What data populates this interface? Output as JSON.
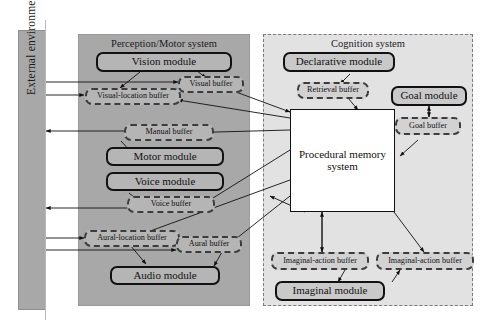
{
  "figure": {
    "type": "diagram",
    "background": "#ffffff"
  },
  "environment": {
    "label": "External environment",
    "color": "#a8a8a8"
  },
  "panels": {
    "perception": {
      "title": "Perception/Motor system",
      "color": "#a8a8a8",
      "border": "solid"
    },
    "cognition": {
      "title": "Cognition system",
      "color": "#e2e2e2",
      "border": "dashed"
    }
  },
  "nodes": {
    "vision_module": {
      "label": "Vision module",
      "kind": "module"
    },
    "visual_buffer": {
      "label": "Visual buffer",
      "kind": "buffer"
    },
    "visual_location_buffer": {
      "label": "Visual-location buffer",
      "kind": "buffer"
    },
    "manual_buffer": {
      "label": "Manual buffer",
      "kind": "buffer"
    },
    "motor_module": {
      "label": "Motor module",
      "kind": "module"
    },
    "voice_module": {
      "label": "Voice module",
      "kind": "module"
    },
    "voice_buffer": {
      "label": "Voice buffer",
      "kind": "buffer"
    },
    "aural_location_buffer": {
      "label": "Aural-location buffer",
      "kind": "buffer"
    },
    "aural_buffer": {
      "label": "Aural buffer",
      "kind": "buffer"
    },
    "audio_module": {
      "label": "Audio module",
      "kind": "module"
    },
    "declarative_module": {
      "label": "Declarative module",
      "kind": "module"
    },
    "retrieval_buffer": {
      "label": "Retrieval buffer",
      "kind": "buffer"
    },
    "goal_module": {
      "label": "Goal module",
      "kind": "module"
    },
    "goal_buffer": {
      "label": "Goal buffer",
      "kind": "buffer"
    },
    "procedural_memory_line1": {
      "label": "Procedural memory",
      "kind": "box"
    },
    "procedural_memory_line2": {
      "label": "system",
      "kind": "box"
    },
    "imaginal_action_buffer_left": {
      "label": "Imaginal-action buffer",
      "kind": "buffer"
    },
    "imaginal_action_buffer_right": {
      "label": "Imaginal-action buffer",
      "kind": "buffer"
    },
    "imaginal_module": {
      "label": "Imaginal module",
      "kind": "module"
    }
  },
  "colors": {
    "module_fill": "#b5b5b5",
    "buffer_fill": "#b5b5b5",
    "buffer_fill_light": "#d2d2d2",
    "perception_panel": "#a8a8a8",
    "cognition_panel": "#e2e2e2",
    "procedural_fill": "#ffffff",
    "stroke": "#111111"
  }
}
